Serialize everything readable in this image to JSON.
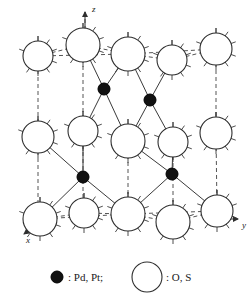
{
  "figure": {
    "background_color": "#ffffff",
    "width": 252,
    "height": 304
  },
  "axes": [
    {
      "name": "z",
      "label": "z",
      "direction": "up",
      "label_x": 92,
      "label_y": 12,
      "line": [
        85,
        30,
        85,
        12
      ],
      "arrow": "up"
    },
    {
      "name": "y",
      "label": "y",
      "direction": "right",
      "label_x": 242,
      "label_y": 228,
      "line": [
        222,
        219,
        238,
        219
      ],
      "arrow": "right"
    },
    {
      "name": "x",
      "label": "x",
      "direction": "down-left",
      "label_x": 26,
      "label_y": 243,
      "line": [
        40,
        222,
        24,
        234
      ],
      "arrow": "down-left"
    }
  ],
  "atom_types": [
    {
      "id": "metal",
      "label": "Pd, Pt",
      "style": "filled",
      "color": "#111111",
      "radius": 6
    },
    {
      "id": "chalcogen",
      "label": "O, S",
      "style": "open",
      "color": "#ffffff",
      "radius": 14
    }
  ],
  "legend": {
    "items": [
      {
        "symbol": "filled-circle",
        "text": ": Pd, Pt;",
        "circle_x": 57,
        "circle_y": 277,
        "circle_r": 6,
        "text_x": 68,
        "text_y": 281
      },
      {
        "symbol": "open-circle",
        "text": ": O, S",
        "circle_x": 147,
        "circle_y": 277,
        "circle_r": 15,
        "text_x": 166,
        "text_y": 281
      }
    ]
  },
  "chart_data": {
    "type": "scatter",
    "xlabel": "y",
    "ylabel": "z",
    "zlabel": "x",
    "grid": false,
    "legend_position": "bottom",
    "atoms": [
      {
        "id": "o1",
        "type": "chalcogen",
        "cx": 38,
        "cy": 56,
        "r": 15
      },
      {
        "id": "o2",
        "type": "chalcogen",
        "cx": 83,
        "cy": 45,
        "r": 17
      },
      {
        "id": "o3",
        "type": "chalcogen",
        "cx": 128,
        "cy": 54,
        "r": 17
      },
      {
        "id": "o4",
        "type": "chalcogen",
        "cx": 172,
        "cy": 60,
        "r": 15
      },
      {
        "id": "o5",
        "type": "chalcogen",
        "cx": 216,
        "cy": 49,
        "r": 16
      },
      {
        "id": "o6",
        "type": "chalcogen",
        "cx": 38,
        "cy": 137,
        "r": 16
      },
      {
        "id": "o7",
        "type": "chalcogen",
        "cx": 83,
        "cy": 131,
        "r": 15
      },
      {
        "id": "o8",
        "type": "chalcogen",
        "cx": 128,
        "cy": 141,
        "r": 17
      },
      {
        "id": "o9",
        "type": "chalcogen",
        "cx": 173,
        "cy": 142,
        "r": 15
      },
      {
        "id": "o10",
        "type": "chalcogen",
        "cx": 216,
        "cy": 133,
        "r": 16
      },
      {
        "id": "o11",
        "type": "chalcogen",
        "cx": 40,
        "cy": 219,
        "r": 17
      },
      {
        "id": "o12",
        "type": "chalcogen",
        "cx": 84,
        "cy": 213,
        "r": 15
      },
      {
        "id": "o13",
        "type": "chalcogen",
        "cx": 128,
        "cy": 214,
        "r": 17
      },
      {
        "id": "o14",
        "type": "chalcogen",
        "cx": 173,
        "cy": 222,
        "r": 17
      },
      {
        "id": "o15",
        "type": "chalcogen",
        "cx": 217,
        "cy": 211,
        "r": 16
      },
      {
        "id": "m1",
        "type": "metal",
        "cx": 104,
        "cy": 89,
        "r": 6
      },
      {
        "id": "m2",
        "type": "metal",
        "cx": 150,
        "cy": 100,
        "r": 6
      },
      {
        "id": "m3",
        "type": "metal",
        "cx": 83,
        "cy": 177,
        "r": 6
      },
      {
        "id": "m4",
        "type": "metal",
        "cx": 172,
        "cy": 174,
        "r": 6
      }
    ],
    "bonds_solid": [
      [
        104,
        89,
        83,
        45
      ],
      [
        104,
        89,
        128,
        54
      ],
      [
        104,
        89,
        83,
        131
      ],
      [
        104,
        89,
        128,
        141
      ],
      [
        150,
        100,
        128,
        54
      ],
      [
        150,
        100,
        172,
        60
      ],
      [
        150,
        100,
        128,
        141
      ],
      [
        150,
        100,
        173,
        142
      ],
      [
        83,
        177,
        38,
        137
      ],
      [
        83,
        177,
        83,
        131
      ],
      [
        83,
        177,
        40,
        219
      ],
      [
        83,
        177,
        128,
        214
      ],
      [
        172,
        174,
        128,
        141
      ],
      [
        172,
        174,
        173,
        142
      ],
      [
        172,
        174,
        128,
        214
      ],
      [
        172,
        174,
        217,
        211
      ]
    ],
    "bonds_dashed": [
      [
        38,
        56,
        83,
        45
      ],
      [
        83,
        45,
        128,
        54
      ],
      [
        128,
        54,
        172,
        60
      ],
      [
        172,
        60,
        216,
        49
      ],
      [
        38,
        56,
        128,
        54
      ],
      [
        128,
        54,
        216,
        49
      ],
      [
        38,
        56,
        38,
        137
      ],
      [
        83,
        45,
        83,
        131
      ],
      [
        216,
        49,
        216,
        133
      ],
      [
        38,
        137,
        38,
        219
      ],
      [
        83,
        131,
        83,
        213
      ],
      [
        128,
        141,
        128,
        214
      ],
      [
        173,
        142,
        173,
        222
      ],
      [
        216,
        133,
        217,
        211
      ],
      [
        40,
        219,
        84,
        213
      ],
      [
        84,
        213,
        128,
        214
      ],
      [
        128,
        214,
        173,
        222
      ],
      [
        173,
        222,
        217,
        211
      ],
      [
        40,
        219,
        128,
        214
      ],
      [
        128,
        214,
        217,
        211
      ],
      [
        85,
        30,
        85,
        12
      ]
    ]
  }
}
